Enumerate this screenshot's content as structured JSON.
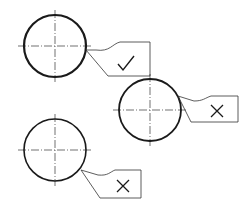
{
  "title_fragment": "",
  "colors": {
    "stroke": "#1a1a1a",
    "thin": "#333333",
    "background": "#ffffff"
  },
  "cases": [
    {
      "id": "case-1",
      "verdict": "correct",
      "mark": "✓",
      "circle": {
        "cx": 55,
        "cy": 46,
        "r": 31,
        "stroke_width": 2.2
      },
      "tool": {
        "path": "M86,50 L108,76 L150,76 L150,42 L120,42 C112,44 110,52 96,50 Z",
        "mark_x": 126,
        "mark_y": 64
      }
    },
    {
      "id": "case-2",
      "verdict": "incorrect",
      "mark": "✕",
      "circle": {
        "cx": 150,
        "cy": 110,
        "r": 31,
        "stroke_width": 1.8
      },
      "tool": {
        "path": "M178,96 L191,122 L238,122 L238,96 L211,96 C205,98 203,101 194,101 Z",
        "mark_x": 217,
        "mark_y": 111
      }
    },
    {
      "id": "case-3",
      "verdict": "incorrect",
      "mark": "✕",
      "circle": {
        "cx": 55,
        "cy": 150,
        "r": 31,
        "stroke_width": 1.6
      },
      "tool": {
        "path": "M81,170 L100,198 L141,198 L141,170 L115,170 C110,172 108,176 98,175 Z",
        "mark_x": 123,
        "mark_y": 186
      }
    }
  ]
}
